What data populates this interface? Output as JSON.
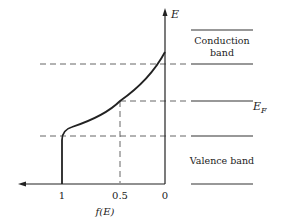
{
  "diagram": {
    "title": "",
    "axes": {
      "y_label": "E",
      "x_label": "f(E)",
      "x_ticks": [
        "1",
        "0.5",
        "0"
      ]
    },
    "bands": {
      "conduction_line1": "Conduction",
      "conduction_line2": "band",
      "fermi_label": "E",
      "fermi_subscript": "F",
      "valence": "Valence band"
    },
    "colors": {
      "ink": "#222222",
      "dashed": "#555555",
      "background": "#ffffff"
    }
  }
}
